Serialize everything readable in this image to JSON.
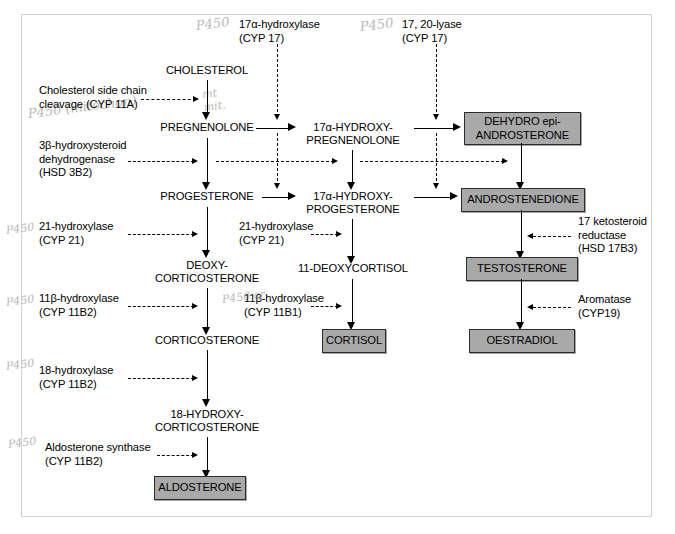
{
  "diagram": {
    "colors": {
      "box_fill": "#a9a9a9",
      "box_border": "#2b2b2b",
      "line": "#000000",
      "frame": "#d2d2d2",
      "pencil": "#b9b6b3"
    }
  },
  "metabolites": {
    "cholesterol": "CHOLESTEROL",
    "pregnenolone": "PREGNENOLONE",
    "progesterone": "PROGESTERONE",
    "deoxycorticosterone": "DEOXY-\nCORTICOSTERONE",
    "corticosterone": "CORTICOSTERONE",
    "hydroxycorticosterone": "18-HYDROXY-\nCORTICOSTERONE",
    "hydroxypregnenolone": "17α-HYDROXY-\nPREGNENOLONE",
    "hydroxyprogesterone": "17α-HYDROXY-\nPROGESTERONE",
    "deoxycortisol": "11-DEOXYCORTISOL"
  },
  "products": {
    "dhea": "DEHYDRO epi-\nANDROSTERONE",
    "androstenedione": "ANDROSTENEDIONE",
    "testosterone": "TESTOSTERONE",
    "oestradiol": "OESTRADIOL",
    "cortisol": "CORTISOL",
    "aldosterone": "ALDOSTERONE"
  },
  "enzymes": {
    "scc": "Cholesterol side chain\ncleavage (CYP 11A)",
    "hsd3b2": "3β-hydroxysteroid\ndehydrogenase\n(HSD 3B2)",
    "cyp21_left": "21-hydroxylase\n(CYP 21)",
    "cyp21_mid": "21-hydroxylase\n(CYP 21)",
    "cyp11b2_11beta": "11β-hydroxylase\n(CYP 11B2)",
    "cyp11b1_11beta": "11β-hydroxylase\n(CYP 11B1)",
    "cyp11b2_18": "18-hydroxylase\n(CYP 11B2)",
    "aldo_synthase": "Aldosterone synthase\n(CYP 11B2)",
    "cyp17_17a": "17α-hydroxylase\n(CYP 17)",
    "cyp17_lyase": "17, 20-lyase\n(CYP 17)",
    "hsd17b3": "17 ketosteroid\nreductase\n(HSD 17B3)",
    "aromatase": "Aromatase\n(CYP19)"
  },
  "annotations": {
    "p450_top_left": "P450",
    "p450_top_right": "P450",
    "p450_mito": "P450 (mitochon)",
    "p450_scc_arrow": "mt\nmit.",
    "p450_cyp21": "P450",
    "p450_11b_left": "P450",
    "p450_11b_mid": "P450 cr",
    "p450_18": "P450",
    "p450_aldo": "P450"
  }
}
